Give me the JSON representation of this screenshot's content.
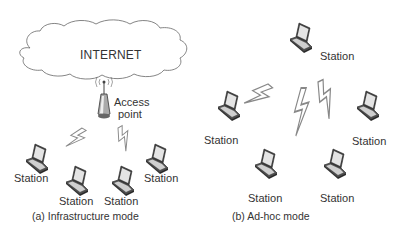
{
  "infrastructure": {
    "cloud_label": "INTERNET",
    "access_point_label_line1": "Access",
    "access_point_label_line2": "point",
    "stations": [
      "Station",
      "Station",
      "Station",
      "Station"
    ],
    "caption": "(a) Infrastructure mode"
  },
  "adhoc": {
    "stations": [
      "Station",
      "Station",
      "Station",
      "Station",
      "Station"
    ],
    "caption": "(b) Ad-hoc mode"
  },
  "colors": {
    "line": "#555555",
    "laptop_dark": "#3a3a3a",
    "laptop_screen": "#dcdcdc",
    "bolt": "#8a8a8a"
  }
}
